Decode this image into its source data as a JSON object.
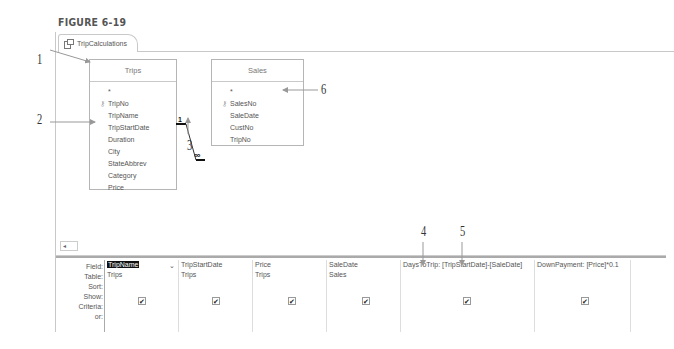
{
  "figure_title": "FIGURE 6-19",
  "tab": {
    "label": "TripCalculations",
    "icon": "query-icon"
  },
  "tables": [
    {
      "name": "Trips",
      "fields": [
        "*",
        "TripNo",
        "TripName",
        "TripStartDate",
        "Duration",
        "City",
        "StateAbbrev",
        "Category",
        "Price"
      ],
      "key_field": "TripNo"
    },
    {
      "name": "Sales",
      "fields": [
        "*",
        "SalesNo",
        "SaleDate",
        "CustNo",
        "TripNo"
      ],
      "key_field": "SalesNo"
    }
  ],
  "relationship": {
    "one_side": "1",
    "many_side": "∞"
  },
  "callouts": [
    "1",
    "2",
    "3",
    "4",
    "5",
    "6"
  ],
  "grid": {
    "row_labels": [
      "Field:",
      "Table:",
      "Sort:",
      "Show:",
      "Criteria:",
      "or:"
    ],
    "columns": [
      {
        "field": "TripName",
        "table": "Trips",
        "show": true
      },
      {
        "field": "TripStartDate",
        "table": "Trips",
        "show": true
      },
      {
        "field": "Price",
        "table": "Trips",
        "show": true
      },
      {
        "field": "SaleDate",
        "table": "Sales",
        "show": true
      },
      {
        "field": "DaysToTrip: [TripStartDate]-[SaleDate]",
        "table": "",
        "show": true
      },
      {
        "field": "DownPayment: [Price]*0.1",
        "table": "",
        "show": true
      }
    ]
  },
  "scroll_left": "◂"
}
